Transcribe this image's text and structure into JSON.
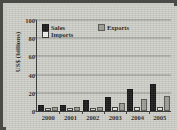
{
  "chart_data": {
    "type": "bar",
    "title": "",
    "xlabel": "",
    "ylabel": "US$ (billions)",
    "ylim": [
      0,
      100
    ],
    "yticks": [
      0,
      20,
      40,
      60,
      80,
      100
    ],
    "grid": true,
    "legend_position": "top-inside",
    "categories": [
      "2000",
      "2001",
      "2002",
      "2003",
      "2004",
      "2005"
    ],
    "series": [
      {
        "name": "Sales",
        "color": "#1a1a1a",
        "values": [
          4,
          4,
          10,
          13.5,
          21.5,
          27
        ]
      },
      {
        "name": "Imports",
        "color": "#e4e4e0",
        "values": [
          1,
          1,
          1.5,
          2,
          2,
          2.5
        ]
      },
      {
        "name": "Exports",
        "color": "#9d9d98",
        "values": [
          2,
          2,
          2.5,
          6.5,
          11,
          14.5
        ]
      }
    ]
  },
  "axis": {
    "y_title": "US$ (billions)",
    "y_ticks": [
      "100",
      "80",
      "60",
      "40",
      "20",
      "0"
    ],
    "x_ticks": [
      "2000",
      "2001",
      "2002",
      "2003",
      "2004",
      "2005"
    ]
  },
  "legend": {
    "sales_label": "Sales",
    "imports_label": "Imports",
    "exports_label": "Exports"
  },
  "colors": {
    "sales": "#1a1a1a",
    "imports": "#e4e4e0",
    "exports": "#9d9d98",
    "background": "#cfcfc9",
    "border": "#4a4a47",
    "grid": "#8f8f8a"
  }
}
